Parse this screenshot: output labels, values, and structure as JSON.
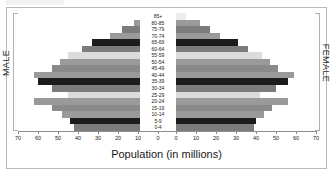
{
  "figure": {
    "axis_title": "Population (in millions)",
    "left_side_label": "MALE",
    "right_side_label": "FEMALE"
  },
  "chart_data": {
    "type": "bar",
    "subtype": "population-pyramid",
    "title": "",
    "xlabel": "Population (in millions)",
    "ylabel": "",
    "xlim_left": [
      70,
      0
    ],
    "xlim_right": [
      0,
      70
    ],
    "xticks_left": [
      70,
      60,
      50,
      40,
      30,
      20,
      10,
      0
    ],
    "xticks_right": [
      0,
      10,
      20,
      30,
      40,
      50,
      60,
      70
    ],
    "grid": false,
    "legend": "none",
    "categories": [
      "85+",
      "80-85",
      "75-79",
      "70-74",
      "65-69",
      "60-64",
      "55-59",
      "50-54",
      "45-49",
      "40-44",
      "35-39",
      "30-34",
      "25-29",
      "20-24",
      "15-19",
      "10-14",
      "5-9",
      "0-4"
    ],
    "series": [
      {
        "name": "MALE",
        "side": "left",
        "values": [
          4,
          12,
          18,
          24,
          33,
          38,
          45,
          49,
          53,
          62,
          60,
          53,
          45,
          62,
          53,
          48,
          44,
          42
        ]
      },
      {
        "name": "FEMALE",
        "side": "right",
        "values": [
          5,
          12,
          17,
          22,
          31,
          36,
          43,
          47,
          51,
          59,
          56,
          50,
          42,
          56,
          48,
          44,
          40,
          39
        ]
      }
    ],
    "bar_colors": [
      "#ededed",
      "#9a9a9a",
      "#7c7c7c",
      "#9a9a9a",
      "#1c1c1c",
      "#7c7c7c",
      "#dcdcdc",
      "#9a9a9a",
      "#8a8a8a",
      "#9a9a9a",
      "#1c1c1c",
      "#7c7c7c",
      "#dcdcdc",
      "#9a9a9a",
      "#8a8a8a",
      "#9a9a9a",
      "#1c1c1c",
      "#7c7c7c"
    ]
  }
}
